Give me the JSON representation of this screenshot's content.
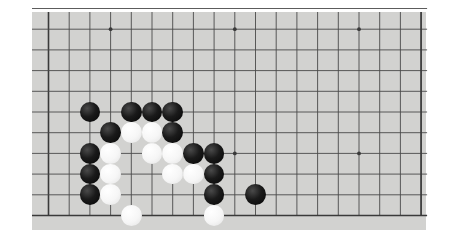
{
  "app": {
    "title": "Go Board",
    "description": "Cropped photograph of a Go (Weiqi/Baduk) board showing a partial position in the upper-left area of the board."
  },
  "board": {
    "surface_color": "#d2d2d0",
    "page_background": "#ffffff",
    "line_color": "#4a4a4a",
    "border_color": "#3a3a3a",
    "black_stone_color": "#111111",
    "white_stone_color": "#f7f7f7",
    "visible_columns": 18,
    "visible_rows": 11,
    "cell_size": 20.7,
    "origin_x": 48.5,
    "origin_y": 8.5,
    "stone_radius": 10.4,
    "surface": {
      "left": 32,
      "top": 12,
      "width": 394,
      "height": 218
    },
    "star_points": [
      {
        "col": 3,
        "row": 1
      },
      {
        "col": 9,
        "row": 1
      },
      {
        "col": 15,
        "row": 1
      },
      {
        "col": 9,
        "row": 7
      },
      {
        "col": 15,
        "row": 7
      }
    ],
    "stones": [
      {
        "color": "black",
        "col": 2,
        "row": 5
      },
      {
        "color": "black",
        "col": 4,
        "row": 5
      },
      {
        "color": "black",
        "col": 5,
        "row": 5
      },
      {
        "color": "black",
        "col": 6,
        "row": 5
      },
      {
        "color": "black",
        "col": 3,
        "row": 6
      },
      {
        "color": "white",
        "col": 4,
        "row": 6
      },
      {
        "color": "white",
        "col": 5,
        "row": 6
      },
      {
        "color": "black",
        "col": 6,
        "row": 6
      },
      {
        "color": "black",
        "col": 2,
        "row": 7
      },
      {
        "color": "white",
        "col": 3,
        "row": 7
      },
      {
        "color": "white",
        "col": 5,
        "row": 7
      },
      {
        "color": "white",
        "col": 6,
        "row": 7
      },
      {
        "color": "black",
        "col": 7,
        "row": 7
      },
      {
        "color": "black",
        "col": 8,
        "row": 7
      },
      {
        "color": "black",
        "col": 2,
        "row": 8
      },
      {
        "color": "white",
        "col": 3,
        "row": 8
      },
      {
        "color": "white",
        "col": 6,
        "row": 8
      },
      {
        "color": "white",
        "col": 7,
        "row": 8
      },
      {
        "color": "black",
        "col": 8,
        "row": 8
      },
      {
        "color": "black",
        "col": 2,
        "row": 9
      },
      {
        "color": "white",
        "col": 3,
        "row": 9
      },
      {
        "color": "black",
        "col": 8,
        "row": 9
      },
      {
        "color": "black",
        "col": 10,
        "row": 9
      },
      {
        "color": "white",
        "col": 4,
        "row": 10
      },
      {
        "color": "white",
        "col": 8,
        "row": 10
      }
    ],
    "stone_counts": {
      "black": 14,
      "white": 11,
      "total": 25
    }
  }
}
